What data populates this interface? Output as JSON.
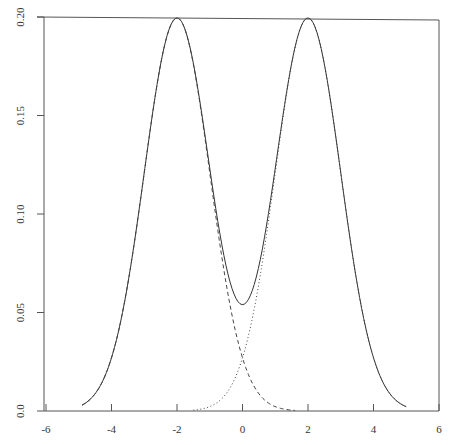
{
  "chart_data": {
    "type": "line",
    "title": "",
    "xlabel": "",
    "ylabel": "",
    "xlim": [
      -6,
      6
    ],
    "ylim": [
      0,
      0.2
    ],
    "grid": false,
    "legend": null,
    "x_ticks": [
      "-6",
      "-4",
      "-2",
      "0",
      "2",
      "4",
      "6"
    ],
    "y_ticks": [
      "0.0",
      "0.05",
      "0.10",
      "0.15",
      "0.20"
    ],
    "series": [
      {
        "name": "mixture density",
        "style": "solid",
        "x": [
          -4.9,
          -4.5,
          -4.0,
          -3.5,
          -3.0,
          -2.5,
          -2.0,
          -1.5,
          -1.0,
          -0.5,
          0.0,
          0.5,
          1.0,
          1.5,
          2.0,
          2.5,
          3.0,
          3.5,
          4.0,
          4.5,
          5.0
        ],
        "y": [
          0.003,
          0.0088,
          0.027,
          0.0648,
          0.121,
          0.176,
          0.1995,
          0.1767,
          0.1237,
          0.0728,
          0.054,
          0.0728,
          0.1237,
          0.1767,
          0.1995,
          0.176,
          0.121,
          0.0648,
          0.027,
          0.0088,
          0.0022
        ]
      },
      {
        "name": "component N(-2,1) x 0.5",
        "style": "dashed",
        "x": [
          -4.9,
          -4.5,
          -4.0,
          -3.5,
          -3.0,
          -2.5,
          -2.0,
          -1.5,
          -1.0,
          -0.5,
          0.0,
          0.5,
          1.0,
          1.6
        ],
        "y": [
          0.003,
          0.0088,
          0.027,
          0.0648,
          0.121,
          0.176,
          0.1995,
          0.176,
          0.121,
          0.0648,
          0.027,
          0.0088,
          0.0022,
          0.0003
        ]
      },
      {
        "name": "component N(2,1) x 0.5",
        "style": "dotted",
        "x": [
          -1.5,
          -1.0,
          -0.5,
          0.0,
          0.5,
          1.0,
          1.5,
          2.0,
          2.5,
          3.0,
          3.5,
          4.0,
          4.5,
          5.0
        ],
        "y": [
          0.0004,
          0.0022,
          0.0088,
          0.027,
          0.0648,
          0.121,
          0.176,
          0.1995,
          0.176,
          0.121,
          0.0648,
          0.027,
          0.0088,
          0.0022
        ]
      }
    ]
  },
  "plot_area": {
    "left": 44,
    "right": 439,
    "top": 17,
    "bottom": 411
  }
}
